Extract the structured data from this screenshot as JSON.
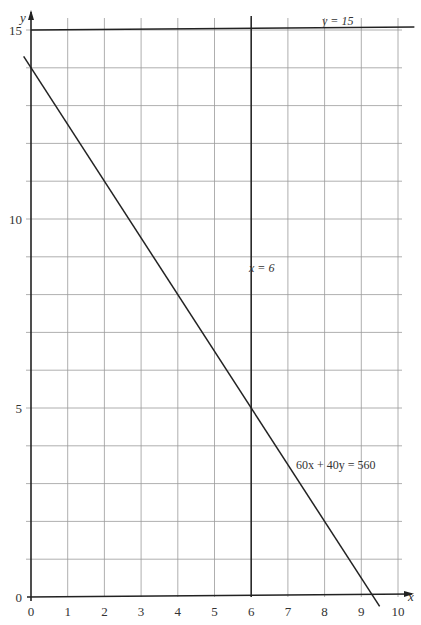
{
  "chart_data": {
    "type": "line",
    "title": "",
    "xlabel": "x",
    "ylabel": "y",
    "xlim": [
      0,
      10
    ],
    "ylim": [
      0,
      15
    ],
    "grid": true,
    "grid_step": 1,
    "x_ticks": [
      0,
      1,
      2,
      3,
      4,
      5,
      6,
      7,
      8,
      9,
      10
    ],
    "x_tick_labels": [
      "0",
      "1",
      "2",
      "3",
      "4",
      "5",
      "6",
      "7",
      "8",
      "9",
      "10"
    ],
    "y_ticks": [
      0,
      5,
      10,
      15
    ],
    "y_tick_labels": [
      "0",
      "5",
      "10",
      "15"
    ],
    "series": [
      {
        "name": "y = 15",
        "kind": "horizontal",
        "y": 15,
        "x": [
          0,
          10.5
        ]
      },
      {
        "name": "x = 6",
        "kind": "vertical",
        "x": 6,
        "y": [
          0,
          15
        ]
      },
      {
        "name": "60x + 40y = 560",
        "kind": "line",
        "x": [
          -0.2,
          9.5
        ],
        "y": [
          14.3,
          -0.25
        ],
        "intercepts": {
          "x": 9.333,
          "y": 14
        }
      }
    ],
    "annotations": [
      {
        "text": "y = 15",
        "x": 7.9,
        "y": 15.15
      },
      {
        "text": "x = 6",
        "x": 6.1,
        "y": 8.6
      },
      {
        "text": "60x + 40y = 560",
        "x": 7.2,
        "y": 3.0
      }
    ],
    "legend": null
  },
  "labels": {
    "y_axis": "y",
    "x_axis": "x",
    "line_y15": "y = 15",
    "line_x6": "x = 6",
    "line_constraint": "60x + 40y = 560"
  }
}
